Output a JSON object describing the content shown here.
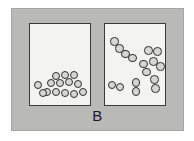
{
  "figure": {
    "label": "B",
    "caption_label": "B",
    "width": 194,
    "height": 141,
    "background_color": "#ffffff",
    "panel_color": "#b9b9b7",
    "panel_border_color": "#a4a4a2",
    "container_fill_color": "#f3f3f1",
    "container_border_color": "#3a3a3a",
    "particle_fill_color": "#d6d6d4",
    "particle_outline_color": "#2e2e2e",
    "label_color": "#1a1a1a"
  },
  "containers": [
    {
      "id": "container-left",
      "name": "left-container",
      "phase_description": "condensed phase: single atoms settled in a cluster at the bottom",
      "particle_type": "single-atom",
      "particle_count": 14,
      "particle_radius": 4.3,
      "particles": [
        {
          "cx": 8,
          "cy": 61
        },
        {
          "cx": 17,
          "cy": 68
        },
        {
          "cx": 26,
          "cy": 68
        },
        {
          "cx": 35,
          "cy": 69
        },
        {
          "cx": 44,
          "cy": 70
        },
        {
          "cx": 53,
          "cy": 68
        },
        {
          "cx": 21,
          "cy": 59
        },
        {
          "cx": 30,
          "cy": 59
        },
        {
          "cx": 39,
          "cy": 58
        },
        {
          "cx": 48,
          "cy": 60
        },
        {
          "cx": 26,
          "cy": 52
        },
        {
          "cx": 35,
          "cy": 51
        },
        {
          "cx": 44,
          "cy": 51
        },
        {
          "cx": 13,
          "cy": 69
        }
      ]
    },
    {
      "id": "container-right",
      "name": "right-container",
      "phase_description": "gas phase: diatomic molecules dispersed through the whole volume",
      "particle_type": "diatomic-molecule",
      "particle_count": 16,
      "molecule_count": 8,
      "particle_radius": 4.3,
      "molecules": [
        {
          "cx": 12,
          "cy": 21,
          "angle": 55
        },
        {
          "cx": 24,
          "cy": 32,
          "angle": 30
        },
        {
          "cx": 48,
          "cy": 27,
          "angle": 10
        },
        {
          "cx": 40,
          "cy": 44,
          "angle": 70
        },
        {
          "cx": 11,
          "cy": 62,
          "angle": 15
        },
        {
          "cx": 31,
          "cy": 63,
          "angle": 90
        },
        {
          "cx": 50,
          "cy": 60,
          "angle": 80
        },
        {
          "cx": 52,
          "cy": 40,
          "angle": 35
        }
      ]
    }
  ],
  "accessibility": {
    "description": "Diagram B: two sealed boxes side by side inside a gray frame. The left box holds fourteen separate atoms piled at the bottom; the right box holds eight two-atom molecules spread evenly through the box."
  }
}
